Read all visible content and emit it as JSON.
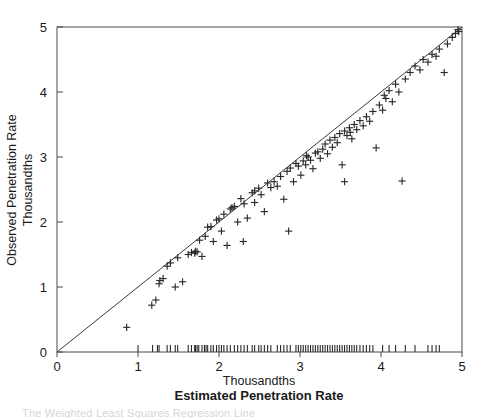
{
  "chart_data": {
    "type": "scatter",
    "title": "",
    "xlabel": "Estimated Penetration Rate",
    "xlabel_units": "Thousandths",
    "ylabel": "Observed Penetration Rate",
    "ylabel_units": "Thousandths",
    "xlim": [
      0,
      5
    ],
    "ylim": [
      0,
      5
    ],
    "xticks": [
      0,
      1,
      2,
      3,
      4,
      5
    ],
    "yticks": [
      0,
      1,
      2,
      3,
      4,
      5
    ],
    "xticklabels": [
      "0",
      "1",
      "2",
      "3",
      "4",
      "5"
    ],
    "yticklabels": [
      "0",
      "1",
      "2",
      "3",
      "4",
      "5"
    ],
    "grid": false,
    "legend": null,
    "marker": "plus",
    "reference_line": {
      "name": "identity-line",
      "from": [
        0,
        0
      ],
      "to": [
        5,
        5
      ],
      "description": "y = x 45-degree reference line"
    },
    "rug_axis": "x",
    "points": [
      [
        0.86,
        0.38
      ],
      [
        1.17,
        0.72
      ],
      [
        1.22,
        0.8
      ],
      [
        1.26,
        1.05
      ],
      [
        1.27,
        1.1
      ],
      [
        1.31,
        1.13
      ],
      [
        1.36,
        1.32
      ],
      [
        1.4,
        1.37
      ],
      [
        1.46,
        1.0
      ],
      [
        1.49,
        1.45
      ],
      [
        1.62,
        1.5
      ],
      [
        1.66,
        1.53
      ],
      [
        1.7,
        1.52
      ],
      [
        1.71,
        1.55
      ],
      [
        1.73,
        1.54
      ],
      [
        1.76,
        1.72
      ],
      [
        1.79,
        1.47
      ],
      [
        1.83,
        1.78
      ],
      [
        1.86,
        1.92
      ],
      [
        1.9,
        1.93
      ],
      [
        1.93,
        1.7
      ],
      [
        1.97,
        2.03
      ],
      [
        2.0,
        2.05
      ],
      [
        2.03,
        1.86
      ],
      [
        2.06,
        2.12
      ],
      [
        2.1,
        1.64
      ],
      [
        2.14,
        2.2
      ],
      [
        2.19,
        2.24
      ],
      [
        2.23,
        2.0
      ],
      [
        2.27,
        2.36
      ],
      [
        2.31,
        2.28
      ],
      [
        2.35,
        2.06
      ],
      [
        2.41,
        2.45
      ],
      [
        2.44,
        2.3
      ],
      [
        2.49,
        2.52
      ],
      [
        2.52,
        2.42
      ],
      [
        2.56,
        2.16
      ],
      [
        2.6,
        2.6
      ],
      [
        2.64,
        2.53
      ],
      [
        2.68,
        2.62
      ],
      [
        2.72,
        2.55
      ],
      [
        2.76,
        2.7
      ],
      [
        2.8,
        2.35
      ],
      [
        2.84,
        2.78
      ],
      [
        2.88,
        2.83
      ],
      [
        2.92,
        2.62
      ],
      [
        2.95,
        2.9
      ],
      [
        2.98,
        2.86
      ],
      [
        3.01,
        2.72
      ],
      [
        3.04,
        2.94
      ],
      [
        3.07,
        2.88
      ],
      [
        3.1,
        3.0
      ],
      [
        3.13,
        2.95
      ],
      [
        3.16,
        2.82
      ],
      [
        3.19,
        3.06
      ],
      [
        3.22,
        3.08
      ],
      [
        3.25,
        2.98
      ],
      [
        3.28,
        3.12
      ],
      [
        3.31,
        3.2
      ],
      [
        3.34,
        3.05
      ],
      [
        3.37,
        3.26
      ],
      [
        3.4,
        3.15
      ],
      [
        3.43,
        3.3
      ],
      [
        3.46,
        3.22
      ],
      [
        3.49,
        3.36
      ],
      [
        3.52,
        2.88
      ],
      [
        3.55,
        3.4
      ],
      [
        3.58,
        3.33
      ],
      [
        3.61,
        3.45
      ],
      [
        3.64,
        3.28
      ],
      [
        3.67,
        3.5
      ],
      [
        3.7,
        3.42
      ],
      [
        3.74,
        3.56
      ],
      [
        3.78,
        3.48
      ],
      [
        3.82,
        3.62
      ],
      [
        3.86,
        3.55
      ],
      [
        3.9,
        3.7
      ],
      [
        3.94,
        3.14
      ],
      [
        3.98,
        3.8
      ],
      [
        4.02,
        3.72
      ],
      [
        4.06,
        3.9
      ],
      [
        4.1,
        4.02
      ],
      [
        4.14,
        3.85
      ],
      [
        4.18,
        4.12
      ],
      [
        4.22,
        4.0
      ],
      [
        4.26,
        2.63
      ],
      [
        4.3,
        4.2
      ],
      [
        4.36,
        4.3
      ],
      [
        4.42,
        4.4
      ],
      [
        4.48,
        4.34
      ],
      [
        4.52,
        4.5
      ],
      [
        4.58,
        4.46
      ],
      [
        4.63,
        4.58
      ],
      [
        4.68,
        4.55
      ],
      [
        4.72,
        4.66
      ],
      [
        4.78,
        4.3
      ],
      [
        4.82,
        4.74
      ],
      [
        4.88,
        4.84
      ],
      [
        4.92,
        4.9
      ],
      [
        4.96,
        4.93
      ],
      [
        2.86,
        1.86
      ],
      [
        3.55,
        2.62
      ],
      [
        2.3,
        1.7
      ],
      [
        1.55,
        1.08
      ],
      [
        4.95,
        4.96
      ],
      [
        2.16,
        2.22
      ],
      [
        2.44,
        2.48
      ],
      [
        3.08,
        3.02
      ],
      [
        3.62,
        3.38
      ],
      [
        4.04,
        3.95
      ]
    ],
    "rug_values": [
      1.0,
      1.18,
      1.24,
      1.26,
      1.36,
      1.4,
      1.46,
      1.49,
      1.62,
      1.66,
      1.7,
      1.71,
      1.73,
      1.75,
      1.79,
      1.82,
      1.84,
      1.86,
      1.9,
      1.93,
      1.97,
      2.0,
      2.03,
      2.06,
      2.1,
      2.14,
      2.19,
      2.23,
      2.27,
      2.31,
      2.35,
      2.41,
      2.44,
      2.49,
      2.52,
      2.56,
      2.6,
      2.64,
      2.72,
      2.76,
      2.8,
      2.84,
      2.88,
      2.95,
      2.98,
      3.01,
      3.04,
      3.07,
      3.1,
      3.13,
      3.16,
      3.19,
      3.22,
      3.25,
      3.28,
      3.31,
      3.34,
      3.37,
      3.4,
      3.43,
      3.46,
      3.49,
      3.52,
      3.55,
      3.58,
      3.61,
      3.64,
      3.67,
      3.7,
      3.74,
      3.78,
      3.82,
      3.86,
      3.9,
      4.02,
      4.1,
      4.18,
      4.3,
      4.42,
      4.58,
      4.63,
      4.68,
      4.72
    ]
  },
  "caption": {
    "partial_text": "The Weighted Least Squares Regression Line"
  }
}
